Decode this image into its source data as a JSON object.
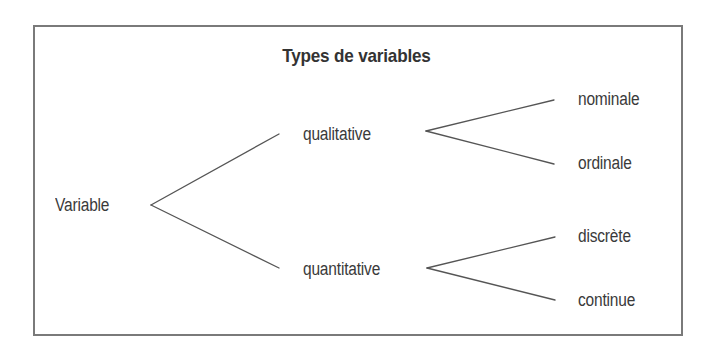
{
  "diagram": {
    "title": "Types de variables",
    "root": {
      "label": "Variable",
      "children": [
        {
          "label": "qualitative",
          "children": [
            {
              "label": "nominale"
            },
            {
              "label": "ordinale"
            }
          ]
        },
        {
          "label": "quantitative",
          "children": [
            {
              "label": "discrète"
            },
            {
              "label": "continue"
            }
          ]
        }
      ]
    },
    "colors": {
      "text": "#3a3a3a",
      "lines": "#555555",
      "border": "#7a7a7a",
      "background": "#ffffff"
    }
  }
}
